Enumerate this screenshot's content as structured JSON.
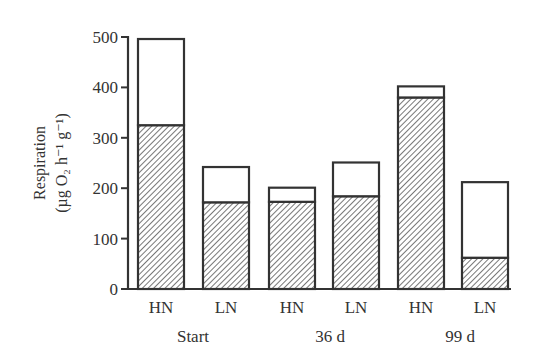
{
  "chart_data": {
    "type": "bar",
    "stacked": true,
    "title": "",
    "xlabel": "",
    "ylabel": "Respiration (µg O2 h−1 g−1)",
    "ylabel_lines": [
      "Respiration",
      "(µg O₂ h⁻¹ g⁻¹)"
    ],
    "ylim": [
      0,
      500
    ],
    "yticks": [
      0,
      100,
      200,
      300,
      400,
      500
    ],
    "grid": false,
    "legend": null,
    "categories": [
      "HN",
      "LN",
      "HN",
      "LN",
      "HN",
      "LN"
    ],
    "groups": [
      {
        "label": "Start",
        "categories": [
          "HN",
          "LN"
        ]
      },
      {
        "label": "36 d",
        "categories": [
          "HN",
          "LN"
        ]
      },
      {
        "label": "99 d",
        "categories": [
          "HN",
          "LN"
        ]
      }
    ],
    "series": [
      {
        "name": "hatched (lower)",
        "pattern": "diagonal-hatch",
        "values": [
          325,
          172,
          173,
          184,
          380,
          62
        ]
      },
      {
        "name": "open (upper)",
        "pattern": "white",
        "values": [
          171,
          70,
          28,
          67,
          22,
          150
        ]
      }
    ],
    "totals": [
      496,
      242,
      201,
      251,
      402,
      212
    ]
  },
  "colors": {
    "axis": "#333333",
    "bar_outline": "#333333",
    "hatch": "#555555",
    "open_fill": "#ffffff"
  }
}
